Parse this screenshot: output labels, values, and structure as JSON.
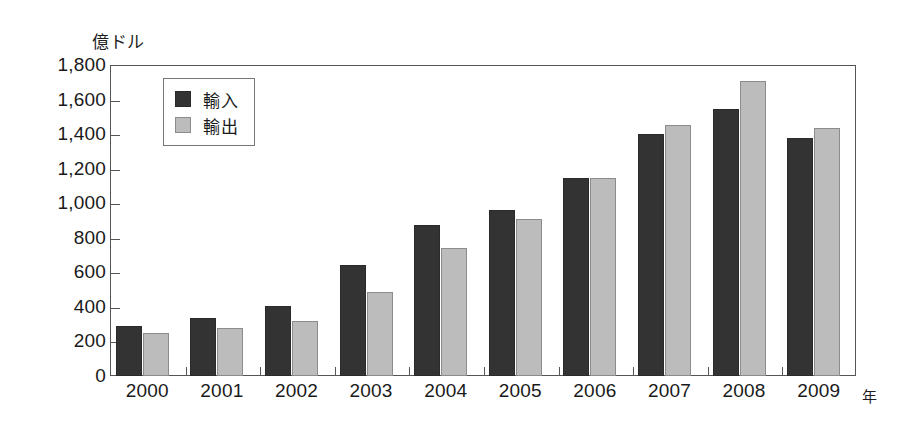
{
  "chart_data": {
    "type": "bar",
    "title": "",
    "subtitle": "",
    "ylabel": "億ドル",
    "xlabel": "年",
    "categories": [
      "2000",
      "2001",
      "2002",
      "2003",
      "2004",
      "2005",
      "2006",
      "2007",
      "2008",
      "2009"
    ],
    "series": [
      {
        "name": "輸入",
        "color": "#333333",
        "values": [
          290,
          335,
          405,
          640,
          875,
          960,
          1145,
          1400,
          1545,
          1375
        ]
      },
      {
        "name": "輸出",
        "color": "#bcbcbc",
        "values": [
          250,
          280,
          320,
          485,
          740,
          910,
          1145,
          1455,
          1710,
          1435
        ]
      }
    ],
    "ylim": [
      0,
      1800
    ],
    "ytick_step": 200,
    "ytick_labels": [
      "1,800",
      "1,600",
      "1,400",
      "1,200",
      "1,000",
      "800",
      "600",
      "400",
      "200",
      "0"
    ],
    "ytick_values": [
      1800,
      1600,
      1400,
      1200,
      1000,
      800,
      600,
      400,
      200,
      0
    ],
    "grid": false,
    "legend_position": "top-left",
    "legend": [
      {
        "label": "輸入",
        "swatch": "import"
      },
      {
        "label": "輸出",
        "swatch": "export"
      }
    ]
  },
  "axis": {
    "unit_caption": "億ドル",
    "x_unit_caption": "年"
  }
}
